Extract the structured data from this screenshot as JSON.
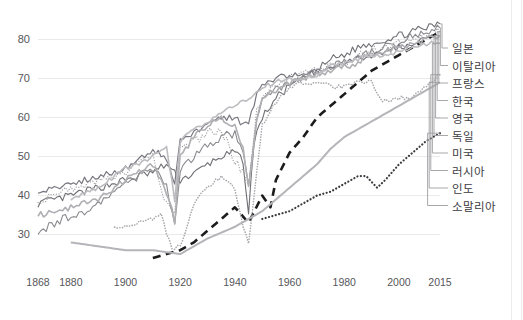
{
  "chart_data": {
    "type": "line",
    "title": "",
    "subtitle": "",
    "xlabel": "",
    "ylabel": "",
    "xlim": [
      1868,
      2015
    ],
    "ylim": [
      24,
      85
    ],
    "xticks": [
      "1868",
      "1880",
      "1900",
      "1920",
      "1940",
      "1960",
      "1980",
      "2000",
      "2015"
    ],
    "xtick_values": [
      1868,
      1880,
      1900,
      1920,
      1940,
      1960,
      1980,
      2000,
      2015
    ],
    "yticks": [
      "30",
      "40",
      "50",
      "60",
      "70",
      "80"
    ],
    "ytick_values": [
      30,
      40,
      50,
      60,
      70,
      80
    ],
    "grid": "horizontal",
    "legend_position": "right-outside",
    "series": [
      {
        "name": "일본",
        "color": "#6f6f74",
        "style": "solid",
        "width": 1.1,
        "jitter": 1.0,
        "x": [
          1868,
          1875,
          1880,
          1885,
          1890,
          1895,
          1900,
          1905,
          1910,
          1915,
          1920,
          1923,
          1926,
          1930,
          1935,
          1940,
          1943,
          1945,
          1947,
          1950,
          1955,
          1960,
          1965,
          1970,
          1975,
          1980,
          1985,
          1990,
          1995,
          2000,
          2005,
          2010,
          2015
        ],
        "y": [
          38,
          39,
          40,
          41,
          42,
          43,
          44,
          45,
          46,
          48,
          44,
          45,
          46,
          48,
          50,
          51,
          49,
          35,
          54,
          60,
          65,
          68,
          70,
          72,
          75,
          76,
          78,
          79,
          80,
          81,
          82,
          83,
          84
        ]
      },
      {
        "name": "이탈리아",
        "color": "#8a8a8f",
        "style": "solid",
        "width": 1.1,
        "jitter": 1.1,
        "x": [
          1868,
          1875,
          1880,
          1885,
          1890,
          1895,
          1900,
          1905,
          1910,
          1915,
          1918,
          1920,
          1925,
          1930,
          1935,
          1940,
          1943,
          1945,
          1948,
          1950,
          1955,
          1960,
          1965,
          1970,
          1975,
          1980,
          1985,
          1990,
          1995,
          2000,
          2005,
          2010,
          2015
        ],
        "y": [
          31,
          33,
          35,
          36,
          38,
          40,
          43,
          45,
          47,
          43,
          32,
          47,
          50,
          53,
          55,
          56,
          50,
          43,
          60,
          64,
          67,
          69,
          70,
          72,
          73,
          74,
          76,
          77,
          78,
          79,
          81,
          82,
          83
        ]
      },
      {
        "name": "프랑스",
        "color": "#9a9a9e",
        "style": "dotted",
        "width": 1.2,
        "jitter": 1.1,
        "x": [
          1868,
          1875,
          1880,
          1885,
          1890,
          1895,
          1900,
          1905,
          1910,
          1914,
          1916,
          1918,
          1920,
          1925,
          1930,
          1935,
          1940,
          1943,
          1945,
          1948,
          1950,
          1955,
          1960,
          1965,
          1970,
          1975,
          1980,
          1985,
          1990,
          1995,
          2000,
          2005,
          2010,
          2015
        ],
        "y": [
          39,
          40,
          42,
          43,
          44,
          45,
          46,
          48,
          50,
          40,
          37,
          35,
          52,
          54,
          56,
          57,
          49,
          46,
          42,
          62,
          65,
          68,
          70,
          71,
          72,
          73,
          74,
          76,
          77,
          78,
          79,
          80,
          81,
          82
        ]
      },
      {
        "name": "한국",
        "color": "#1c1c1c",
        "style": "dashed",
        "width": 2.6,
        "jitter": 0,
        "x": [
          1910,
          1920,
          1925,
          1930,
          1935,
          1940,
          1945,
          1950,
          1953,
          1955,
          1960,
          1965,
          1970,
          1975,
          1980,
          1985,
          1990,
          1995,
          2000,
          2005,
          2010,
          2015
        ],
        "y": [
          24,
          26,
          28,
          31,
          34,
          37,
          33,
          40,
          37,
          44,
          51,
          55,
          60,
          63,
          66,
          69,
          72,
          74,
          76,
          78,
          80,
          82
        ]
      },
      {
        "name": "영국",
        "color": "#777780",
        "style": "solid",
        "width": 1.2,
        "jitter": 0.8,
        "x": [
          1868,
          1875,
          1880,
          1885,
          1890,
          1895,
          1900,
          1905,
          1910,
          1915,
          1918,
          1920,
          1925,
          1930,
          1935,
          1940,
          1943,
          1945,
          1948,
          1950,
          1955,
          1960,
          1965,
          1970,
          1975,
          1980,
          1985,
          1990,
          1995,
          2000,
          2005,
          2010,
          2015
        ],
        "y": [
          41,
          42,
          43,
          44,
          45,
          46,
          47,
          49,
          52,
          49,
          43,
          54,
          56,
          58,
          60,
          60,
          58,
          59,
          66,
          68,
          70,
          71,
          71,
          72,
          73,
          74,
          75,
          76,
          77,
          78,
          79,
          80,
          81
        ]
      },
      {
        "name": "독일",
        "color": "#b0b0b4",
        "style": "solid",
        "width": 1.6,
        "jitter": 0.8,
        "x": [
          1868,
          1875,
          1880,
          1885,
          1890,
          1895,
          1900,
          1905,
          1910,
          1914,
          1917,
          1918,
          1920,
          1925,
          1930,
          1935,
          1940,
          1943,
          1945,
          1948,
          1950,
          1955,
          1960,
          1965,
          1970,
          1975,
          1980,
          1985,
          1990,
          1995,
          2000,
          2005,
          2010,
          2015
        ],
        "y": [
          35,
          36,
          37,
          38,
          39,
          41,
          44,
          46,
          48,
          42,
          37,
          33,
          50,
          55,
          58,
          60,
          58,
          52,
          42,
          60,
          65,
          67,
          69,
          70,
          71,
          72,
          73,
          74,
          76,
          77,
          78,
          79,
          80,
          81
        ]
      },
      {
        "name": "미국",
        "color": "#bdbdc1",
        "style": "solid",
        "width": 1.6,
        "jitter": 0.6,
        "x": [
          1880,
          1890,
          1900,
          1905,
          1910,
          1915,
          1918,
          1920,
          1925,
          1930,
          1935,
          1940,
          1945,
          1950,
          1955,
          1960,
          1965,
          1970,
          1975,
          1980,
          1985,
          1990,
          1995,
          2000,
          2005,
          2010,
          2015
        ],
        "y": [
          39,
          42,
          47,
          48,
          50,
          52,
          39,
          54,
          57,
          59,
          61,
          63,
          65,
          68,
          69,
          70,
          70,
          71,
          73,
          74,
          75,
          76,
          76,
          77,
          78,
          79,
          79
        ]
      },
      {
        "name": "러시아",
        "color": "#a8a8ad",
        "style": "dotted",
        "width": 1.6,
        "jitter": 0.6,
        "x": [
          1896,
          1900,
          1905,
          1910,
          1913,
          1917,
          1920,
          1925,
          1930,
          1935,
          1940,
          1943,
          1945,
          1950,
          1955,
          1960,
          1965,
          1970,
          1975,
          1980,
          1985,
          1990,
          1994,
          2000,
          2005,
          2010,
          2015
        ],
        "y": [
          32,
          32,
          33,
          34,
          35,
          26,
          27,
          38,
          42,
          45,
          42,
          32,
          28,
          58,
          64,
          68,
          69,
          69,
          68,
          68,
          69,
          69,
          64,
          65,
          65,
          68,
          71
        ]
      },
      {
        "name": "인도",
        "color": "#b5b5b9",
        "style": "solid",
        "width": 2.0,
        "jitter": 0,
        "x": [
          1880,
          1890,
          1900,
          1910,
          1920,
          1930,
          1940,
          1950,
          1955,
          1960,
          1965,
          1970,
          1975,
          1980,
          1985,
          1990,
          1995,
          2000,
          2005,
          2010,
          2015
        ],
        "y": [
          28,
          27,
          26,
          26,
          25,
          29,
          32,
          36,
          39,
          42,
          45,
          48,
          52,
          55,
          57,
          59,
          61,
          63,
          65,
          67,
          69
        ]
      },
      {
        "name": "소말리아",
        "color": "#3c3c40",
        "style": "dotted",
        "width": 2.2,
        "jitter": 0,
        "x": [
          1950,
          1955,
          1960,
          1965,
          1970,
          1975,
          1980,
          1985,
          1988,
          1992,
          1995,
          2000,
          2005,
          2010,
          2015
        ],
        "y": [
          34,
          35,
          36,
          38,
          40,
          41,
          43,
          45,
          45,
          42,
          44,
          48,
          51,
          54,
          56
        ]
      }
    ]
  },
  "axis": {
    "y_tick_labels": [
      "80",
      "70",
      "60",
      "50",
      "40",
      "30"
    ],
    "x_tick_labels": [
      "1868",
      "1880",
      "1900",
      "1920",
      "1940",
      "1960",
      "1980",
      "2000",
      "2015"
    ]
  },
  "legend": {
    "items": [
      {
        "label": "일본"
      },
      {
        "label": "이탈리아"
      },
      {
        "label": "프랑스"
      },
      {
        "label": "한국"
      },
      {
        "label": "영국"
      },
      {
        "label": "독일"
      },
      {
        "label": "미국"
      },
      {
        "label": "러시아"
      },
      {
        "label": "인도"
      },
      {
        "label": "소말리아"
      }
    ]
  },
  "colors": {
    "grid": "#e9e9e9",
    "tick_text": "#56565a",
    "legend_text": "#3b3b3f",
    "background": "#ffffff"
  }
}
